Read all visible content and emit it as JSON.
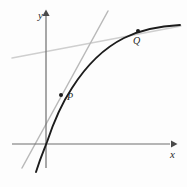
{
  "figure": {
    "kind": "math-diagram",
    "background_color": "#fdfdfd"
  },
  "axes": {
    "x_axis": {
      "label": "x",
      "name": "x-axis",
      "color": "#6e6e6e",
      "y_pixel": 144,
      "x_start": 12,
      "x_end": 172,
      "arrow": "right"
    },
    "y_axis": {
      "label": "y",
      "name": "y-axis",
      "color": "#6e6e6e",
      "x_pixel": 46,
      "y_start": 168,
      "y_end": 14,
      "arrow": "up"
    },
    "origin": {
      "x": 46,
      "y": 144
    }
  },
  "curve": {
    "name": "logarithmic-curve",
    "color": "#1c1c1c",
    "stroke_width": 1.9,
    "shape": "increasing concave down",
    "path": "M 36 172 C 41 156 44 150 47 142 C 53 124 60 106 72 88 C 86 66 104 48 124 38 C 142 29 160 26 180 25"
  },
  "tangent_line": {
    "name": "tangent-line-at-P",
    "color": "#b9b9b9",
    "stroke_width": 1.5,
    "through_point": "P",
    "x1": 108,
    "y1": 11,
    "x2": 22,
    "y2": 168
  },
  "secant_line": {
    "name": "secant-line-through-Q",
    "color": "#cfcfcf",
    "stroke_width": 1.4,
    "through_point": "Q",
    "x1": 12,
    "y1": 58,
    "x2": 181,
    "y2": 26
  },
  "points": [
    {
      "id": "P",
      "label": "P",
      "name": "point-P",
      "dot_x": 61,
      "dot_y": 95,
      "dot_radius": 2.0,
      "color": "#1c1c1c",
      "label_x": 67,
      "label_y": 92
    },
    {
      "id": "Q",
      "label": "Q",
      "name": "point-Q",
      "dot_x": 138,
      "dot_y": 31,
      "dot_radius": 2.0,
      "color": "#1c1c1c",
      "label_x": 133,
      "label_y": 36
    }
  ]
}
